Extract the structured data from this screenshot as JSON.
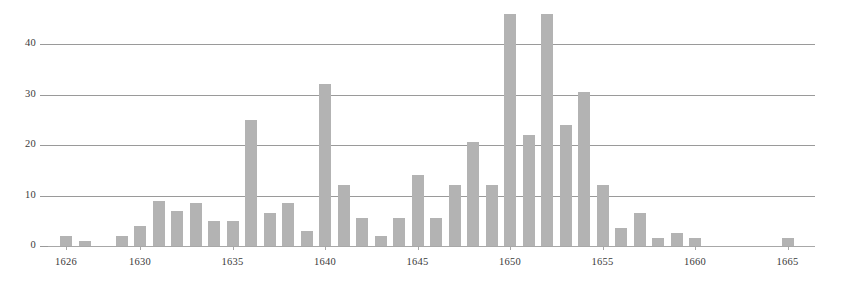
{
  "chart_data": {
    "type": "bar",
    "title": "",
    "subtitle": "",
    "xlabel": "",
    "ylabel": "",
    "grid": true,
    "legend": null,
    "legend_position": "none",
    "xlim": [
      1625,
      1666
    ],
    "ylim": [
      0,
      47
    ],
    "ytick_labels": [
      "0",
      "10",
      "20",
      "30",
      "40"
    ],
    "ytick_values": [
      0,
      10,
      20,
      30,
      40
    ],
    "xtick_labels": [
      "1626",
      "1630",
      "1635",
      "1640",
      "1645",
      "1650",
      "1655",
      "1660",
      "1665"
    ],
    "xtick_values": [
      1626,
      1630,
      1635,
      1640,
      1645,
      1650,
      1655,
      1660,
      1665
    ],
    "categories": [
      1626,
      1627,
      1628,
      1629,
      1630,
      1631,
      1632,
      1633,
      1634,
      1635,
      1636,
      1637,
      1638,
      1639,
      1640,
      1641,
      1642,
      1643,
      1644,
      1645,
      1646,
      1647,
      1648,
      1649,
      1650,
      1651,
      1652,
      1653,
      1654,
      1655,
      1656,
      1657,
      1658,
      1659,
      1660,
      1661,
      1662,
      1663,
      1664,
      1665
    ],
    "values": [
      2,
      1,
      0,
      2,
      4,
      9,
      7,
      8.5,
      5,
      5,
      25,
      6.5,
      8.5,
      3,
      32,
      12,
      5.5,
      2,
      5.5,
      14,
      5.5,
      12,
      20.5,
      12,
      46,
      22,
      46,
      24,
      30.5,
      12,
      3.5,
      6.5,
      1.5,
      2.5,
      1.5,
      0,
      0,
      0,
      0,
      1.5
    ],
    "colors": {
      "bar": "#b3b3b3",
      "gridline": "#9a9a9a",
      "axis": "#a8a8a8",
      "text": "#3a3a3a",
      "background": "#ffffff"
    }
  }
}
